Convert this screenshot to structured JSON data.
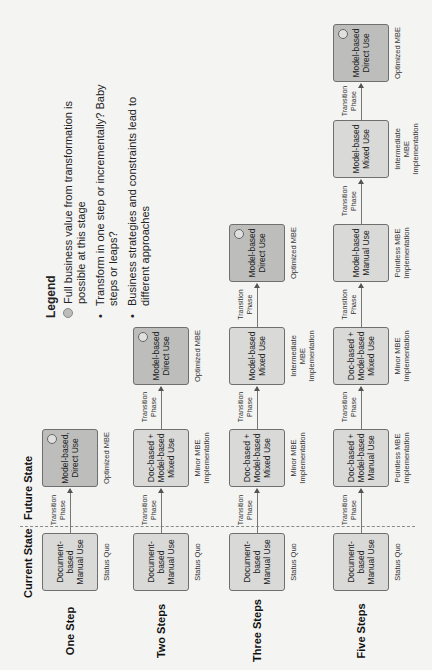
{
  "headers": {
    "current": "Current State",
    "future": "Future State"
  },
  "legend": {
    "title": "Legend",
    "circle_item": "Full business value from transformation is possible at this stage",
    "bullets": [
      "Transform in one step or incrementally? Baby steps or leaps?",
      "Business strategies and constraints lead to different approaches"
    ]
  },
  "transition_label": "Transition Phase",
  "rows": [
    {
      "label": "One Step",
      "states": [
        {
          "box": "Document-based Manual Use",
          "caption": "Status Quo",
          "dark": false,
          "full_value": false
        },
        {
          "box": "Model-based, Direct Use",
          "caption": "Optimized MBE",
          "dark": true,
          "full_value": true
        }
      ]
    },
    {
      "label": "Two Steps",
      "states": [
        {
          "box": "Document-based Manual Use",
          "caption": "Status Quo",
          "dark": false,
          "full_value": false
        },
        {
          "box": "Doc-based + Model-based Mixed Use",
          "caption": "Minor MBE Implementation",
          "dark": false,
          "full_value": false
        },
        {
          "box": "Model-based Direct Use",
          "caption": "Optimized MBE",
          "dark": true,
          "full_value": true
        }
      ]
    },
    {
      "label": "Three Steps",
      "states": [
        {
          "box": "Document-based Manual Use",
          "caption": "Status Quo",
          "dark": false,
          "full_value": false
        },
        {
          "box": "Doc-based + Model-based Mixed Use",
          "caption": "Minor MBE Implementation",
          "dark": false,
          "full_value": false
        },
        {
          "box": "Model-based Mixed Use",
          "caption": "Intermediate MBE Implementation",
          "dark": false,
          "full_value": false
        },
        {
          "box": "Model-based Direct Use",
          "caption": "Optimized MBE",
          "dark": true,
          "full_value": true
        }
      ]
    },
    {
      "label": "Five Steps",
      "states": [
        {
          "box": "Document-based Manual Use",
          "caption": "Status Quo",
          "dark": false,
          "full_value": false
        },
        {
          "box": "Doc-based + Model-based Manual Use",
          "caption": "Pointless MBE Implementation",
          "dark": false,
          "full_value": false
        },
        {
          "box": "Doc-based + Model-based Mixed Use",
          "caption": "Minor MBE Implementation",
          "dark": false,
          "full_value": false
        },
        {
          "box": "Model-based Manual Use",
          "caption": "Pointless MBE Implementation",
          "dark": false,
          "full_value": false
        },
        {
          "box": "Model-based Mixed Use",
          "caption": "Intermediate MBE Implementation",
          "dark": false,
          "full_value": false
        },
        {
          "box": "Model-based Direct Use",
          "caption": "Optimized MBE",
          "dark": true,
          "full_value": true
        }
      ]
    }
  ],
  "colors": {
    "box_light": "#d9d9d8",
    "box_dark": "#bdbdbc",
    "border": "#6f6f6f",
    "page": "#f4f4f2"
  }
}
